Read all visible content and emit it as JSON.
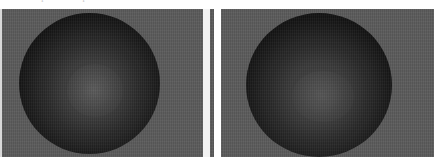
{
  "figure": {
    "title_remnant": "rendered sphere comparison",
    "background_color": "#ffffff",
    "width": 434,
    "height": 167
  },
  "panels": [
    {
      "name": "left-panel",
      "background_color": "#5a5a5a",
      "subject": "sphere",
      "sphere": {
        "fill_center_color": "#4e4e4e",
        "fill_edge_color": "#030303",
        "highlight_color": "#8c8c8c",
        "shape": "circle"
      }
    },
    {
      "name": "right-panel",
      "background_color": "#5a5a5a",
      "subject": "sphere",
      "sphere": {
        "fill_center_color": "#4a4a4a",
        "fill_edge_color": "#020202",
        "highlight_color": "#878787",
        "shape": "circle"
      }
    }
  ],
  "gutter": {
    "color": "#f2f2f2"
  }
}
